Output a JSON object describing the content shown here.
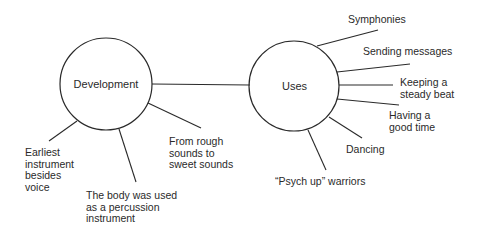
{
  "diagram": {
    "type": "concept-map",
    "colors": {
      "stroke": "#2a2a2a",
      "background": "#ffffff",
      "text": "#2a2a2a"
    },
    "nodes": {
      "development": {
        "label": "Development",
        "cx": 106,
        "cy": 84,
        "r": 46
      },
      "uses": {
        "label": "Uses",
        "cx": 294,
        "cy": 86,
        "r": 45
      }
    },
    "connection": {
      "from": "development",
      "to": "uses"
    },
    "development_branches": [
      {
        "label": "Earliest\ninstrument\nbesides\nvoice"
      },
      {
        "label": "The body was used\nas a percussion\ninstrument"
      },
      {
        "label": "From rough\nsounds to\nsweet sounds"
      }
    ],
    "uses_branches": [
      {
        "label": "Symphonies"
      },
      {
        "label": "Sending messages"
      },
      {
        "label": "Keeping a\nsteady beat"
      },
      {
        "label": "Having a\ngood time"
      },
      {
        "label": "Dancing"
      },
      {
        "label": "“Psych up” warriors"
      }
    ]
  }
}
